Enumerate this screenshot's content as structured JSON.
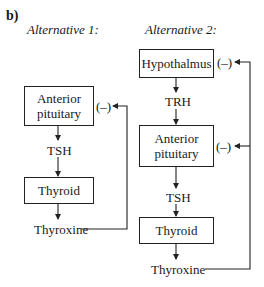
{
  "figure_label": "b)",
  "alternative_1": {
    "title": "Alternative 1:",
    "nodes": {
      "anterior_pituitary": "Anterior pituitary",
      "tsh": "TSH",
      "thyroid": "Thyroid",
      "thyroxine": "Thyroxine"
    },
    "feedback": [
      {
        "target": "anterior_pituitary",
        "sign": "(–)"
      }
    ]
  },
  "alternative_2": {
    "title": "Alternative 2:",
    "nodes": {
      "hypothalamus": "Hypothalmus",
      "trh": "TRH",
      "anterior_pituitary": "Anterior pituitary",
      "tsh": "TSH",
      "thyroid": "Thyroid",
      "thyroxine": "Thyroxine"
    },
    "feedback": [
      {
        "target": "hypothalamus",
        "sign": "(–)"
      },
      {
        "target": "anterior_pituitary",
        "sign": "(–)"
      }
    ]
  },
  "split_labels": {
    "anterior_line1": "Anterior",
    "anterior_line2": "pituitary"
  }
}
